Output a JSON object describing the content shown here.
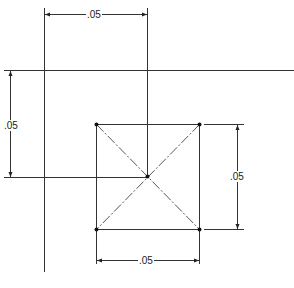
{
  "diagram": {
    "type": "technical-drawing",
    "dimensions": {
      "top": ".05",
      "left": ".05",
      "right": ".05",
      "bottom": ".05"
    },
    "colors": {
      "line": "#222222",
      "background": "#ffffff"
    }
  }
}
